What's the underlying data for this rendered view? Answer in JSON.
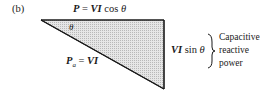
{
  "figure": {
    "panel_label": "(b)",
    "triangle": {
      "fill": "#d9d9d9",
      "stroke": "#1a1a1a",
      "vertices": [
        [
          41,
          20
        ],
        [
          164,
          20
        ],
        [
          164,
          89
        ]
      ]
    },
    "angle_label": "θ",
    "top_side": {
      "lhs": "P",
      "eq": "=",
      "rhs_vi": "VI",
      "rhs_fn": "cos",
      "rhs_theta": "θ"
    },
    "hypotenuse": {
      "lhs": "P",
      "lhs_sub": "a",
      "eq": "=",
      "rhs": "VI"
    },
    "right_side": {
      "vi": "VI",
      "fn": "sin",
      "theta": "θ"
    },
    "annotation": {
      "lines": [
        "Capacitive",
        "reactive",
        "power"
      ]
    }
  }
}
